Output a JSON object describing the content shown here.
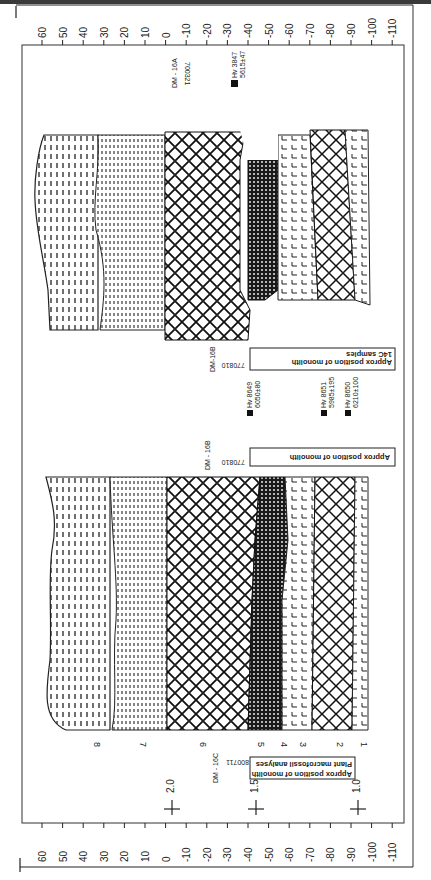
{
  "diagram": {
    "type": "stratigraphic-section",
    "orientation": "rotated-90",
    "scale_ticks": [
      "60",
      "50",
      "40",
      "30",
      "20",
      "10",
      "0",
      "-10",
      "-20",
      "-30",
      "-40",
      "-50",
      "-60",
      "-70",
      "-80",
      "-90",
      "-100",
      "-110"
    ],
    "top_labels": {
      "core_id": "DM - 16A",
      "date_code": "700321",
      "sample": {
        "lab": "Hv 3847",
        "age": "5615±47"
      }
    },
    "middle_section": {
      "monolith_box": {
        "line1": "Approx position of monolith",
        "line2": "14C samples"
      },
      "core_id": "DM-16B",
      "date_code": "770810",
      "samples": [
        {
          "lab": "Hv 8649",
          "age": "6050±80"
        },
        {
          "lab": "Hv 8651",
          "age": "5985±195"
        },
        {
          "lab": "Hv 8650",
          "age": "6210±100"
        }
      ]
    },
    "lower_section": {
      "monolith_box": {
        "line1": "Approx position of monolith"
      },
      "core_id": "DM - 16B",
      "date_code": "770810"
    },
    "bottom_labels": {
      "monolith_box": {
        "line1": "Approx position of monolith",
        "line2": "Plant macrofossil analyses"
      },
      "core_id": "DM - 16C",
      "date_code": "800711",
      "markers": [
        "2.0",
        "1.5",
        "1.0"
      ]
    },
    "layers": [
      "8",
      "7",
      "6",
      "5",
      "4",
      "3",
      "2",
      "1"
    ]
  }
}
